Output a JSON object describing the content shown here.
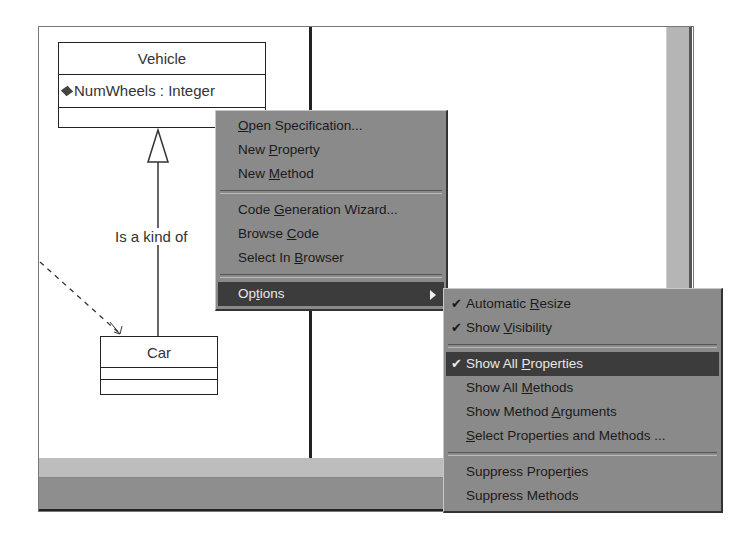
{
  "diagram": {
    "classes": [
      {
        "name": "Vehicle",
        "attributes": [
          {
            "icon": "attribute-icon",
            "text": "NumWheels : Integer"
          }
        ]
      },
      {
        "name": "Car",
        "attributes": []
      }
    ],
    "association_label": "Is a kind of"
  },
  "context_menu": {
    "items": [
      {
        "label": "Open Specification...",
        "mnemonic": "O"
      },
      {
        "label": "New Property",
        "mnemonic": "P"
      },
      {
        "label": "New Method",
        "mnemonic": "M"
      },
      {
        "separator": true
      },
      {
        "label": "Code Generation Wizard...",
        "mnemonic": "G"
      },
      {
        "label": "Browse Code",
        "mnemonic": "C"
      },
      {
        "label": "Select In Browser",
        "mnemonic": "B"
      },
      {
        "separator": true
      },
      {
        "label": "Options",
        "mnemonic": "t",
        "has_submenu": true,
        "highlighted": true
      }
    ]
  },
  "options_submenu": {
    "items": [
      {
        "label": "Automatic Resize",
        "mnemonic": "R",
        "checked": true
      },
      {
        "label": "Show Visibility",
        "mnemonic": "V",
        "checked": true
      },
      {
        "separator": true
      },
      {
        "label": "Show All Properties",
        "mnemonic": "P",
        "checked": true,
        "highlighted": true
      },
      {
        "label": "Show All Methods",
        "mnemonic": "M",
        "checked": false
      },
      {
        "label": "Show Method Arguments",
        "mnemonic": "A",
        "checked": false
      },
      {
        "label": "Select Properties and Methods ...",
        "mnemonic": "S",
        "checked": false
      },
      {
        "separator": true
      },
      {
        "label": "Suppress Properties",
        "mnemonic": "t",
        "checked": false
      },
      {
        "label": "Suppress Methods",
        "mnemonic": "",
        "checked": false
      }
    ]
  },
  "colors": {
    "menu_bg": "#8a8a8a",
    "menu_highlight": "#3c3c3c",
    "canvas": "#ffffff"
  },
  "glyphs": {
    "check": "✔"
  }
}
